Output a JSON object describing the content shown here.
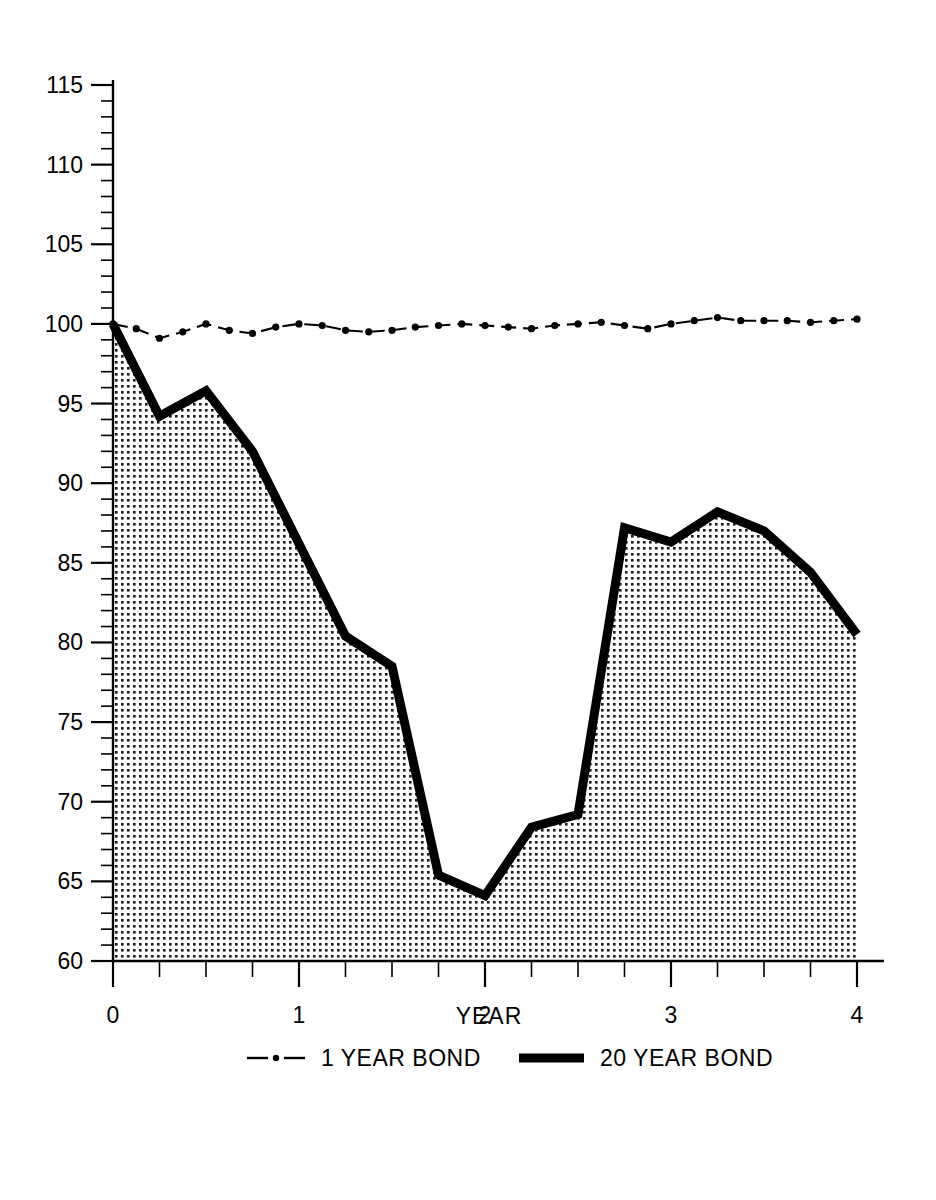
{
  "chart_data": {
    "type": "line",
    "title": "",
    "xlabel": "YEAR",
    "ylabel": "",
    "xlim": [
      0,
      4
    ],
    "ylim": [
      60,
      115
    ],
    "grid": false,
    "legend_position": "bottom",
    "x_ticks": [
      "0",
      "1",
      "2",
      "3",
      "4"
    ],
    "x_tick_values": [
      0,
      1,
      2,
      3,
      4
    ],
    "x_minor_step": 0.25,
    "y_ticks": [
      "60",
      "65",
      "70",
      "75",
      "80",
      "85",
      "90",
      "95",
      "100",
      "105",
      "110",
      "115"
    ],
    "y_tick_values": [
      60,
      65,
      70,
      75,
      80,
      85,
      90,
      95,
      100,
      105,
      110,
      115
    ],
    "y_minor_step": 1,
    "fill_baseline": 60,
    "series": [
      {
        "name": "1 YEAR BOND",
        "style": "dash-dot",
        "marker": "dot",
        "filled": false,
        "x": [
          0,
          0.125,
          0.25,
          0.375,
          0.5,
          0.625,
          0.75,
          0.875,
          1.0,
          1.125,
          1.25,
          1.375,
          1.5,
          1.625,
          1.75,
          1.875,
          2.0,
          2.125,
          2.25,
          2.375,
          2.5,
          2.625,
          2.75,
          2.875,
          3.0,
          3.125,
          3.25,
          3.375,
          3.5,
          3.625,
          3.75,
          3.875,
          4.0
        ],
        "values": [
          100.0,
          99.7,
          99.1,
          99.5,
          100.0,
          99.6,
          99.4,
          99.8,
          100.0,
          99.9,
          99.6,
          99.5,
          99.6,
          99.8,
          99.9,
          100.0,
          99.9,
          99.8,
          99.7,
          99.9,
          100.0,
          100.1,
          99.9,
          99.7,
          100.0,
          100.2,
          100.4,
          100.2,
          100.2,
          100.2,
          100.1,
          100.2,
          100.3
        ]
      },
      {
        "name": "20 YEAR BOND",
        "style": "solid-thick",
        "marker": "none",
        "filled": true,
        "x": [
          0,
          0.25,
          0.5,
          0.75,
          1.0,
          1.25,
          1.5,
          1.75,
          2.0,
          2.25,
          2.5,
          2.75,
          3.0,
          3.25,
          3.5,
          3.75,
          4.0
        ],
        "values": [
          100.0,
          94.2,
          95.8,
          92.0,
          86.2,
          80.4,
          78.5,
          65.4,
          64.1,
          68.4,
          69.2,
          87.2,
          86.3,
          88.2,
          87.0,
          84.4,
          80.5
        ]
      }
    ]
  },
  "legend": {
    "items": [
      {
        "label": "1 YEAR BOND",
        "style": "dash-dot"
      },
      {
        "label": "20 YEAR BOND",
        "style": "solid-thick"
      }
    ]
  },
  "colors": {
    "foreground": "#000000",
    "background": "#ffffff",
    "fill_pattern_dot": "#1a1a1a"
  }
}
